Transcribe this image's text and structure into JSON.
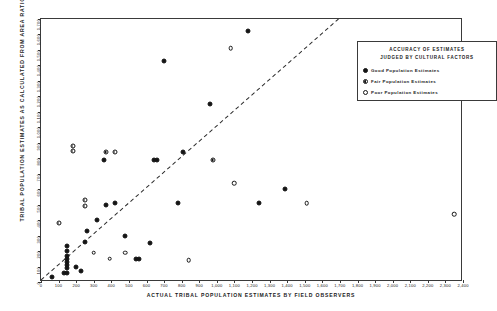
{
  "chart_data": {
    "type": "scatter",
    "title": "",
    "xlabel": "ACTUAL TRIBAL POPULATION ESTIMATES BY FIELD OBSERVERS",
    "ylabel": "TRIBAL POPULATION ESTIMATES AS CALCULATED FROM AREA RATIOS",
    "xlim": [
      0,
      2400
    ],
    "ylim": [
      0,
      1700
    ],
    "grid": false,
    "legend_position": "top-right",
    "xticks": [
      "0",
      "100",
      "200",
      "300",
      "400",
      "500",
      "600",
      "700",
      "800",
      "900",
      "1,000",
      "1,100",
      "1,200",
      "1,300",
      "1,400",
      "1,500",
      "1,600",
      "1,700",
      "1,800",
      "1,900",
      "2,000",
      "2,100",
      "2,200",
      "2,300",
      "2,400"
    ],
    "xtick_values": [
      0,
      100,
      200,
      300,
      400,
      500,
      600,
      700,
      800,
      900,
      1000,
      1100,
      1200,
      1300,
      1400,
      1500,
      1600,
      1700,
      1800,
      1900,
      2000,
      2100,
      2200,
      2300,
      2400
    ],
    "yticks": [
      "0",
      "100",
      "200",
      "300",
      "400",
      "500",
      "600",
      "700",
      "800",
      "900",
      "1,000",
      "1,100",
      "1,200",
      "1,300",
      "1,400",
      "1,500",
      "1,600",
      "1,700"
    ],
    "ytick_values": [
      0,
      100,
      200,
      300,
      400,
      500,
      600,
      700,
      800,
      900,
      1000,
      1100,
      1200,
      1300,
      1400,
      1500,
      1600,
      1700
    ],
    "reference_line": {
      "type": "identity-dashed",
      "x0": 0,
      "y0": 0,
      "x1": 1700,
      "y1": 1700
    },
    "series": [
      {
        "name": "Good Population Estimates",
        "marker": "filled-circle",
        "color": "#141414",
        "points": [
          [
            60,
            30
          ],
          [
            130,
            60
          ],
          [
            150,
            60
          ],
          [
            150,
            90
          ],
          [
            150,
            110
          ],
          [
            150,
            130
          ],
          [
            150,
            150
          ],
          [
            150,
            170
          ],
          [
            150,
            200
          ],
          [
            150,
            230
          ],
          [
            200,
            100
          ],
          [
            230,
            70
          ],
          [
            250,
            260
          ],
          [
            260,
            330
          ],
          [
            320,
            400
          ],
          [
            360,
            790
          ],
          [
            370,
            500
          ],
          [
            420,
            510
          ],
          [
            480,
            300
          ],
          [
            540,
            150
          ],
          [
            560,
            150
          ],
          [
            620,
            250
          ],
          [
            640,
            790
          ],
          [
            660,
            790
          ],
          [
            700,
            1430
          ],
          [
            780,
            510
          ],
          [
            810,
            840
          ],
          [
            960,
            1150
          ],
          [
            1180,
            1620
          ],
          [
            1240,
            510
          ],
          [
            1390,
            600
          ]
        ]
      },
      {
        "name": "Fair Population Estimates",
        "marker": "half-filled-circle",
        "color": "#141414",
        "points": [
          [
            100,
            380
          ],
          [
            180,
            850
          ],
          [
            180,
            880
          ],
          [
            250,
            530
          ],
          [
            250,
            490
          ],
          [
            370,
            840
          ],
          [
            420,
            840
          ],
          [
            980,
            790
          ]
        ]
      },
      {
        "name": "Poor Population Estimates",
        "marker": "open-circle",
        "color": "#ffffff",
        "points": [
          [
            300,
            190
          ],
          [
            390,
            150
          ],
          [
            480,
            190
          ],
          [
            840,
            140
          ],
          [
            1080,
            1510
          ],
          [
            1100,
            640
          ],
          [
            1510,
            510
          ],
          [
            2350,
            440
          ]
        ]
      }
    ]
  },
  "legend": {
    "title_line1": "ACCURACY OF ESTIMATES",
    "title_line2": "JUDGED BY CULTURAL FACTORS",
    "entries": [
      {
        "marker": "good",
        "label": "Good Population Estimates"
      },
      {
        "marker": "fair",
        "label": "Fair Population Estimates"
      },
      {
        "marker": "poor",
        "label": "Poor Population Estimates"
      }
    ]
  }
}
